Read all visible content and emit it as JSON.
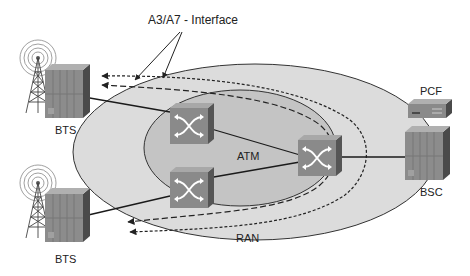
{
  "diagram": {
    "title_callout": "A3/A7 - Interface",
    "regions": {
      "outer": "RAN",
      "inner": "ATM"
    },
    "nodes": {
      "bts_top": "BTS",
      "bts_bottom": "BTS",
      "bsc": "BSC",
      "pcf": "PCF"
    },
    "colors": {
      "outer_ellipse": "#dcdcdc",
      "inner_ellipse": "#c4c4c4",
      "switch": "#8a8a8a",
      "cabinet": "#8c8c8c",
      "line": "#1a1a1a"
    }
  }
}
